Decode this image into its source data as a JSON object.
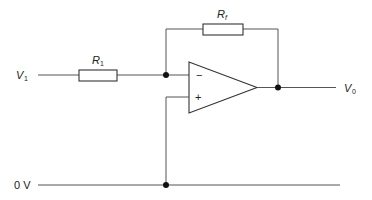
{
  "diagram": {
    "labels": {
      "input_voltage": {
        "main": "V",
        "sub": "1"
      },
      "output_voltage": {
        "main": "V",
        "sub": "0"
      },
      "ground": "0 V",
      "input_resistor": {
        "main": "R",
        "sub": "1"
      },
      "feedback_resistor": {
        "main": "R",
        "sub": "f"
      },
      "inverting_input_sign": "−",
      "non_inverting_input_sign": "+"
    },
    "components": [
      {
        "id": "R1",
        "type": "resistor",
        "label": "R1"
      },
      {
        "id": "Rf",
        "type": "resistor",
        "label": "Rf"
      },
      {
        "id": "opamp",
        "type": "operational-amplifier",
        "inputs": [
          "−",
          "+"
        ]
      }
    ],
    "nodes": [
      {
        "id": "summing-junction",
        "connects": [
          "R1",
          "Rf",
          "opamp −"
        ]
      },
      {
        "id": "output-node",
        "connects": [
          "opamp output",
          "Rf",
          "V0"
        ]
      },
      {
        "id": "ground-node",
        "connects": [
          "opamp +",
          "0 V"
        ]
      }
    ],
    "colors": {
      "wire": "#555555",
      "component_outline": "#333333",
      "node": "#111111",
      "background": "#ffffff"
    }
  }
}
